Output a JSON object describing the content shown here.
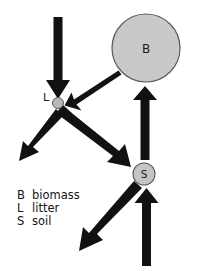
{
  "diagram": {
    "background_color": "#ffffff",
    "arrow_color": "#111111",
    "node_fill_color": "#c9c9c9",
    "node_stroke_color": "#555555",
    "label_color": "#141414",
    "nodes": [
      {
        "id": "B",
        "label": "B",
        "meaning": "biomass",
        "shape": "circle",
        "cx": 146,
        "cy": 48,
        "r": 34,
        "size": "large"
      },
      {
        "id": "L",
        "label": "L",
        "meaning": "litter",
        "shape": "circle",
        "cx": 58,
        "cy": 103,
        "r": 5.5,
        "size": "small"
      },
      {
        "id": "S",
        "label": "S",
        "meaning": "soil",
        "shape": "circle",
        "cx": 144,
        "cy": 174,
        "r": 11,
        "size": "medium"
      }
    ],
    "arrows": [
      {
        "name": "input-to-litter",
        "from": "external-top",
        "to": "L",
        "weight": "thick",
        "direction": "down"
      },
      {
        "name": "biomass-to-litter",
        "from": "B",
        "to": "L",
        "weight": "thin",
        "direction": "down-left"
      },
      {
        "name": "litter-loss",
        "from": "L",
        "to": "external-lower-left",
        "weight": "thick",
        "direction": "down-left"
      },
      {
        "name": "litter-to-soil",
        "from": "L",
        "to": "S",
        "weight": "very-thick",
        "direction": "down-right"
      },
      {
        "name": "soil-to-biomass",
        "from": "S",
        "to": "B",
        "weight": "thick",
        "direction": "up"
      },
      {
        "name": "input-to-soil",
        "from": "external-bottom",
        "to": "S",
        "weight": "thick",
        "direction": "up"
      },
      {
        "name": "soil-loss",
        "from": "S",
        "to": "external-bottom-left",
        "weight": "thick",
        "direction": "down-left"
      }
    ]
  },
  "legend": {
    "entries": [
      {
        "key": "B",
        "label": "biomass"
      },
      {
        "key": "L",
        "label": "litter"
      },
      {
        "key": "S",
        "label": "soil"
      }
    ]
  }
}
